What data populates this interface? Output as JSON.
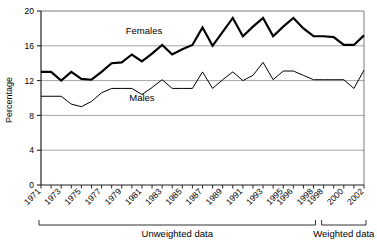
{
  "chart_data": {
    "type": "line",
    "title": "",
    "subtitle": "",
    "xlabel": "",
    "ylabel": "Percentage",
    "ylim": [
      0,
      20
    ],
    "yticks": [
      0,
      4,
      8,
      12,
      16,
      20
    ],
    "grid": true,
    "legend_position": "inline-annotation",
    "x": [
      "1971",
      "1972",
      "1973",
      "1974",
      "1975",
      "1976",
      "1977",
      "1978",
      "1979",
      "1980",
      "1981",
      "1982",
      "1983",
      "1984",
      "1985",
      "1986",
      "1987",
      "1988",
      "1989",
      "1990",
      "1991",
      "1992",
      "1993",
      "1994",
      "1995",
      "1996",
      "1997",
      "1998",
      "1998w",
      "1999",
      "2000",
      "2001",
      "2002"
    ],
    "xtick_labels": [
      "1971",
      "",
      "1973",
      "",
      "1975",
      "",
      "1977",
      "",
      "1979",
      "",
      "1981",
      "",
      "1983",
      "",
      "1985",
      "",
      "1987",
      "",
      "1989",
      "",
      "1991",
      "",
      "1993",
      "",
      "1995",
      "1996",
      "",
      "1998",
      "1998",
      "",
      "2000",
      "",
      "2002"
    ],
    "series": [
      {
        "name": "Females",
        "color": "#000000",
        "width": 2.2,
        "values": [
          13.0,
          13.0,
          12.0,
          13.0,
          12.2,
          12.1,
          13.0,
          14.0,
          14.1,
          15.0,
          14.2,
          15.1,
          16.1,
          15.0,
          15.6,
          16.1,
          18.1,
          16.0,
          17.6,
          19.2,
          17.1,
          18.2,
          19.2,
          17.1,
          18.2,
          19.2,
          18.0,
          17.1,
          17.1,
          17.0,
          16.1,
          16.1,
          17.2
        ]
      },
      {
        "name": "Males",
        "color": "#000000",
        "width": 1.0,
        "values": [
          10.2,
          10.2,
          10.2,
          9.3,
          9.0,
          9.6,
          10.6,
          11.1,
          11.1,
          11.1,
          10.4,
          11.2,
          12.1,
          11.1,
          11.1,
          11.1,
          13.0,
          11.1,
          12.1,
          13.0,
          12.0,
          12.6,
          14.1,
          12.1,
          13.1,
          13.1,
          12.6,
          12.1,
          12.1,
          12.1,
          12.1,
          11.1,
          13.2
        ]
      }
    ],
    "annotations": [
      {
        "name": "females-series-label",
        "text": "Females",
        "x": 1981.2,
        "y": 17.4
      },
      {
        "name": "males-series-label",
        "text": "Males",
        "x": 1981.0,
        "y": 9.7
      }
    ],
    "groups": [
      {
        "name": "unweighted",
        "label": "Unweighted data",
        "from_index": 0,
        "to_index": 27
      },
      {
        "name": "weighted",
        "label": "Weighted data",
        "from_index": 28,
        "to_index": 32
      }
    ]
  }
}
